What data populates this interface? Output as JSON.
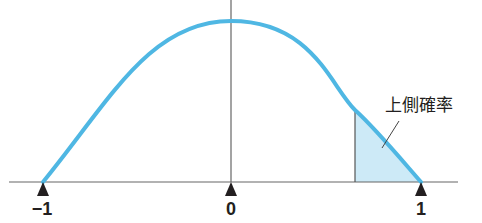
{
  "diagram": {
    "type": "symmetric distribution curve on bounded interval",
    "x_ticks": [
      {
        "value": -1,
        "label": "−1"
      },
      {
        "value": 0,
        "label": "0"
      },
      {
        "value": 1,
        "label": "1"
      }
    ],
    "shaded_region": {
      "label": "上側確率",
      "from_x": 0.65,
      "to_x": 1
    },
    "colors": {
      "curve": "#4fb7e3",
      "shade": "#cdeaf7",
      "axis": "#555555",
      "marker": "#231f20",
      "text": "#231f20"
    }
  }
}
